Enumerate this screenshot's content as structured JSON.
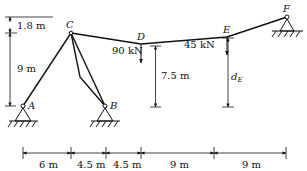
{
  "diagram": {
    "type": "cable-supported structure",
    "nodes": {
      "A": {
        "label": "A"
      },
      "B": {
        "label": "B"
      },
      "C": {
        "label": "C"
      },
      "D": {
        "label": "D"
      },
      "E": {
        "label": "E"
      },
      "F": {
        "label": "F"
      }
    },
    "loads": [
      {
        "node": "D",
        "label": "90 kN"
      },
      {
        "node": "E",
        "label": "45 kN"
      }
    ],
    "vertical_dimensions": [
      {
        "label": "1.8 m"
      },
      {
        "label": "9 m"
      },
      {
        "label": "7.5 m"
      },
      {
        "label_main": "d",
        "label_sub": "E"
      }
    ],
    "horizontal_dimensions": [
      {
        "label": "6 m"
      },
      {
        "label": "4.5 m"
      },
      {
        "label": "4.5 m"
      },
      {
        "label": "9 m"
      },
      {
        "label": "9 m"
      }
    ],
    "colors": {
      "line": "#111111",
      "background": "#ffffff"
    }
  }
}
